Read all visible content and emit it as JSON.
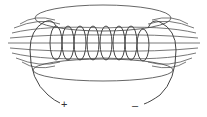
{
  "diagram": {
    "coil_turns": 8,
    "terminals": {
      "positive": "+",
      "negative": "–"
    },
    "colors": {
      "line": "#444444",
      "background": "#ffffff"
    }
  }
}
